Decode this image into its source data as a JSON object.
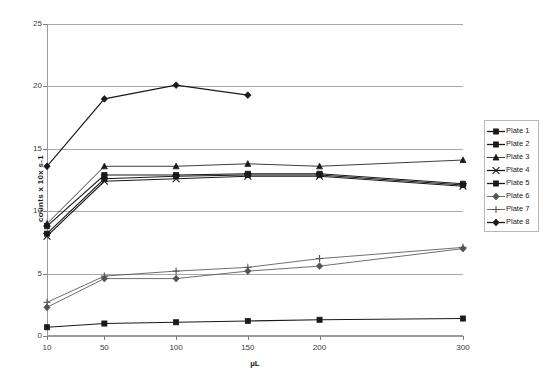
{
  "chart_data": {
    "type": "line",
    "title": "",
    "xlabel": "µL",
    "ylabel": "counts x 10x s-1",
    "categories": [
      "10",
      "50",
      "100",
      "150",
      "200",
      "300"
    ],
    "x_values": [
      10,
      50,
      100,
      150,
      200,
      300
    ],
    "ylim": [
      0,
      25
    ],
    "yticks": [
      0,
      5,
      10,
      15,
      20,
      25
    ],
    "grid": true,
    "legend_position": "right",
    "series": [
      {
        "name": "Plate 1",
        "marker": "x-square",
        "values": [
          8.2,
          12.6,
          12.8,
          12.9,
          12.9,
          12.1
        ]
      },
      {
        "name": "Plate 2",
        "marker": "square",
        "values": [
          0.7,
          1.0,
          1.1,
          1.2,
          1.3,
          1.4
        ]
      },
      {
        "name": "Plate 3",
        "marker": "triangle",
        "values": [
          9.0,
          13.6,
          13.6,
          13.8,
          13.6,
          14.1
        ]
      },
      {
        "name": "Plate 4",
        "marker": "x",
        "values": [
          8.0,
          12.4,
          12.6,
          12.8,
          12.8,
          12.0
        ]
      },
      {
        "name": "Plate 5",
        "marker": "square-x",
        "values": [
          8.8,
          12.9,
          12.9,
          13.0,
          13.0,
          12.2
        ]
      },
      {
        "name": "Plate 6",
        "marker": "diamond",
        "values": [
          2.3,
          4.6,
          4.6,
          5.2,
          5.6,
          7.0
        ]
      },
      {
        "name": "Plate 7",
        "marker": "plus",
        "values": [
          2.7,
          4.8,
          5.2,
          5.5,
          6.2,
          7.1
        ]
      },
      {
        "name": "Plate 8",
        "marker": "diamond",
        "values": [
          13.6,
          19.0,
          20.1,
          19.3,
          null,
          null
        ]
      }
    ],
    "series_colors": [
      "#1a1a1a",
      "#1a1a1a",
      "#1a1a1a",
      "#1a1a1a",
      "#1a1a1a",
      "#555555",
      "#555555",
      "#1a1a1a"
    ]
  },
  "legend": {
    "items": [
      {
        "label": "Plate 1"
      },
      {
        "label": "Plate 2"
      },
      {
        "label": "Plate 3"
      },
      {
        "label": "Plate 4"
      },
      {
        "label": "Plate 5"
      },
      {
        "label": "Plate 6"
      },
      {
        "label": "Plate 7"
      },
      {
        "label": "Plate 8"
      }
    ]
  },
  "axes": {
    "y_tick_labels": [
      "25",
      "20",
      "15",
      "10",
      "5",
      "0"
    ],
    "x_tick_labels": [
      "10",
      "50",
      "100",
      "150",
      "200",
      "300"
    ],
    "y_axis_title": "counts x 10x s-1",
    "x_axis_title": "µL"
  }
}
